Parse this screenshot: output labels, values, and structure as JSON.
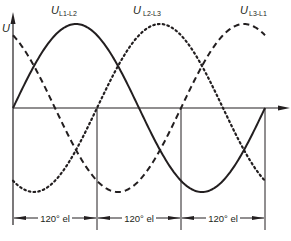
{
  "chart_data": {
    "type": "line",
    "title": "",
    "xlabel": "",
    "ylabel": "U",
    "x_unit": "degrees electrical",
    "x": [
      0,
      30,
      60,
      90,
      120,
      150,
      180,
      210,
      240,
      270,
      300,
      330,
      360
    ],
    "xlim": [
      0,
      360
    ],
    "ylim": [
      -1,
      1
    ],
    "grid": false,
    "series": [
      {
        "name": "U L1-L2",
        "symbol": "U",
        "subscript": "L1-L2",
        "style": "solid",
        "phase_deg": 0,
        "values": [
          0,
          0.5,
          0.87,
          1,
          0.87,
          0.5,
          0,
          -0.5,
          -0.87,
          -1,
          -0.87,
          -0.5,
          0
        ]
      },
      {
        "name": "U L2-L3",
        "symbol": "U",
        "subscript": "L2-L3",
        "style": "dotted",
        "phase_deg": -120,
        "values": [
          -0.87,
          -1,
          -0.87,
          -0.5,
          0,
          0.5,
          0.87,
          1,
          0.87,
          0.5,
          0,
          -0.5,
          -0.87
        ]
      },
      {
        "name": "U L3-L1",
        "symbol": "U",
        "subscript": "L3-L1",
        "style": "dashed",
        "phase_deg": 120,
        "values": [
          0.87,
          0.5,
          0,
          -0.5,
          -0.87,
          -1,
          -0.87,
          -0.5,
          0,
          0.5,
          0.87,
          1,
          0.87
        ]
      }
    ],
    "dimensions": [
      {
        "from_deg": 0,
        "to_deg": 120,
        "label": "120° el"
      },
      {
        "from_deg": 120,
        "to_deg": 240,
        "label": "120° el"
      },
      {
        "from_deg": 240,
        "to_deg": 360,
        "label": "120° el"
      }
    ]
  },
  "labels": {
    "y_axis": "U",
    "series_symbol": "U",
    "l1l2_sub": "L1-L2",
    "l2l3_sub": "L2-L3",
    "l3l1_sub": "L3-L1",
    "dim_1": "120° el",
    "dim_2": "120° el",
    "dim_3": "120° el"
  },
  "colors": {
    "ink": "#231f20",
    "background": "#ffffff"
  }
}
